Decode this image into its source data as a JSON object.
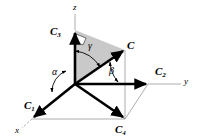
{
  "figure": {
    "colors": {
      "stroke": "#000000",
      "thin_line": "#7a7a7a",
      "shade_fill": "#c9c9c9",
      "background": "#ffffff"
    },
    "axes": [
      {
        "id": "z",
        "label": "z",
        "x": 74,
        "y": 9
      },
      {
        "id": "y",
        "label": "y",
        "x": 186,
        "y": 83
      },
      {
        "id": "x",
        "label": "x",
        "x": 17,
        "y": 133
      }
    ],
    "vectors": [
      {
        "id": "C",
        "label": "C",
        "sub": "",
        "x": 128,
        "y": 48
      },
      {
        "id": "C1",
        "label": "C",
        "sub": "1",
        "x": 26,
        "y": 108
      },
      {
        "id": "C2",
        "label": "C",
        "sub": "2",
        "x": 157,
        "y": 76
      },
      {
        "id": "C3",
        "label": "C",
        "sub": "3",
        "x": 52,
        "y": 34
      },
      {
        "id": "C4",
        "label": "C",
        "sub": "4",
        "x": 116,
        "y": 136
      }
    ],
    "angles": [
      {
        "id": "alpha",
        "label": "α",
        "x": 55,
        "y": 79
      },
      {
        "id": "beta",
        "label": "β",
        "x": 111,
        "y": 75
      },
      {
        "id": "gamma",
        "label": "γ",
        "x": 90,
        "y": 50
      }
    ],
    "geometry": {
      "origin": {
        "x": 75,
        "y": 84
      },
      "z_tip": {
        "x": 75,
        "y": 30
      },
      "z_axis_end": {
        "x": 75,
        "y": 14
      },
      "c_tip": {
        "x": 125,
        "y": 50
      },
      "y_tip": {
        "x": 148,
        "y": 84
      },
      "y_axis_end": {
        "x": 181,
        "y": 84
      },
      "x_tip": {
        "x": 32,
        "y": 119
      },
      "x_axis_end": {
        "x": 22,
        "y": 128
      },
      "c4_tip": {
        "x": 125,
        "y": 119
      },
      "shade_polygon": "75,30 125,50 75,84",
      "right_angle_marker": "75,36 85,40 82,47 75,44"
    }
  }
}
